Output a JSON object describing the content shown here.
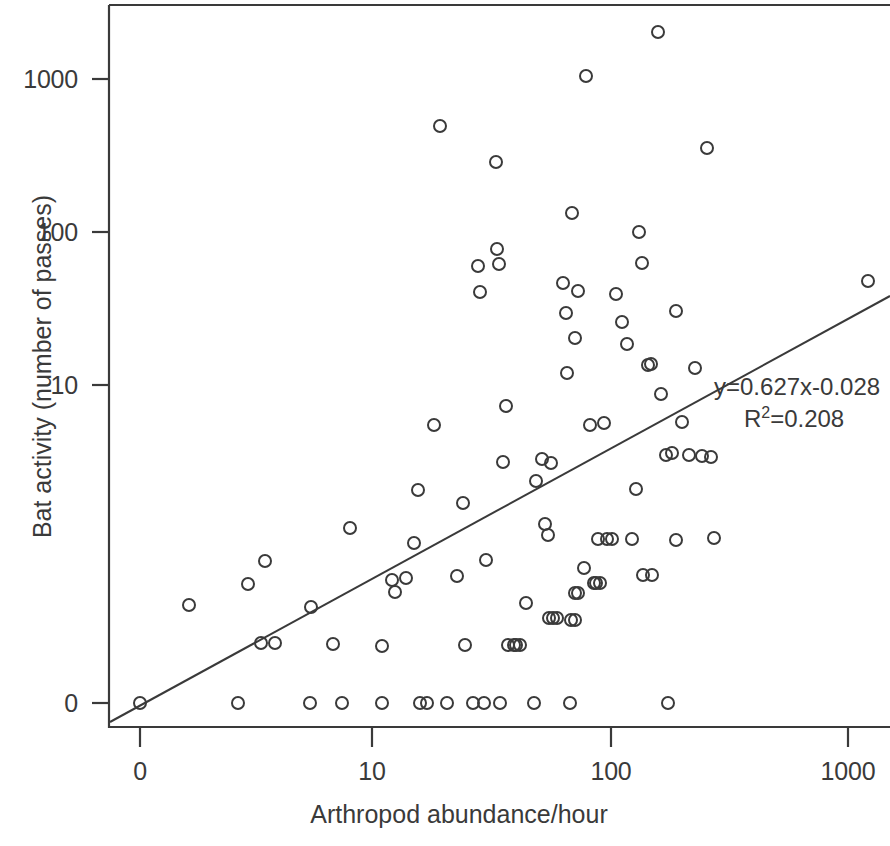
{
  "figure": {
    "axis_color": "#3a3a3a",
    "point_color": "#3a3a3a",
    "background": "#ffffff"
  },
  "annotation": {
    "equation": "y=0.627x-0.028",
    "r_label": "R",
    "r_exponent": "2",
    "r_value": "=0.208"
  },
  "chart_data": {
    "type": "scatter",
    "title": "",
    "xlabel": "Arthropod abundance/hour",
    "ylabel": "Bat activity (number of passes)",
    "xscale": "log",
    "yscale": "log",
    "xticks": [
      "0",
      "10",
      "100",
      "1000"
    ],
    "xtick_px": [
      140,
      372,
      611,
      848
    ],
    "yticks": [
      "1000",
      "100",
      "10",
      "0"
    ],
    "ytick_px": [
      79,
      232,
      385,
      703
    ],
    "grid": false,
    "legend": null,
    "fit_line": {
      "equation": "y=0.627x-0.028",
      "slope": 0.627,
      "intercept": -0.028,
      "r_squared": 0.208,
      "px_start": [
        110,
        722
      ],
      "px_end": [
        890,
        296
      ]
    },
    "points_px": [
      [
        140,
        703
      ],
      [
        189,
        605
      ],
      [
        238,
        703
      ],
      [
        248,
        584
      ],
      [
        265,
        561
      ],
      [
        261,
        643
      ],
      [
        275,
        643
      ],
      [
        310,
        703
      ],
      [
        311,
        607
      ],
      [
        333,
        644
      ],
      [
        342,
        703
      ],
      [
        350,
        528
      ],
      [
        382,
        703
      ],
      [
        382,
        646
      ],
      [
        392,
        580
      ],
      [
        395,
        592
      ],
      [
        406,
        578
      ],
      [
        414,
        543
      ],
      [
        420,
        703
      ],
      [
        427,
        703
      ],
      [
        418,
        490
      ],
      [
        434,
        425
      ],
      [
        440,
        126
      ],
      [
        447,
        703
      ],
      [
        457,
        576
      ],
      [
        463,
        503
      ],
      [
        465,
        645
      ],
      [
        473,
        703
      ],
      [
        478,
        266
      ],
      [
        480,
        292
      ],
      [
        484,
        703
      ],
      [
        486,
        560
      ],
      [
        496,
        162
      ],
      [
        500,
        703
      ],
      [
        497,
        249
      ],
      [
        499,
        264
      ],
      [
        503,
        462
      ],
      [
        506,
        406
      ],
      [
        508,
        645
      ],
      [
        514,
        645
      ],
      [
        520,
        645
      ],
      [
        516,
        645
      ],
      [
        526,
        603
      ],
      [
        534,
        703
      ],
      [
        536,
        481
      ],
      [
        542,
        459
      ],
      [
        545,
        524
      ],
      [
        548,
        535
      ],
      [
        551,
        463
      ],
      [
        549,
        618
      ],
      [
        553,
        618
      ],
      [
        557,
        618
      ],
      [
        563,
        283
      ],
      [
        566,
        313
      ],
      [
        570,
        703
      ],
      [
        567,
        373
      ],
      [
        572,
        213
      ],
      [
        575,
        338
      ],
      [
        571,
        620
      ],
      [
        575,
        620
      ],
      [
        575,
        593
      ],
      [
        578,
        593
      ],
      [
        578,
        291
      ],
      [
        584,
        568
      ],
      [
        586,
        76
      ],
      [
        590,
        425
      ],
      [
        594,
        583
      ],
      [
        596,
        583
      ],
      [
        600,
        583
      ],
      [
        598,
        539
      ],
      [
        604,
        423
      ],
      [
        607,
        539
      ],
      [
        612,
        539
      ],
      [
        616,
        294
      ],
      [
        622,
        322
      ],
      [
        627,
        344
      ],
      [
        632,
        539
      ],
      [
        639,
        232
      ],
      [
        636,
        489
      ],
      [
        642,
        263
      ],
      [
        648,
        365
      ],
      [
        651,
        364
      ],
      [
        643,
        575
      ],
      [
        652,
        575
      ],
      [
        658,
        32
      ],
      [
        661,
        394
      ],
      [
        668,
        703
      ],
      [
        666,
        455
      ],
      [
        672,
        453
      ],
      [
        676,
        311
      ],
      [
        676,
        540
      ],
      [
        682,
        422
      ],
      [
        689,
        455
      ],
      [
        695,
        368
      ],
      [
        702,
        456
      ],
      [
        707,
        148
      ],
      [
        711,
        457
      ],
      [
        714,
        538
      ],
      [
        868,
        281
      ]
    ]
  }
}
